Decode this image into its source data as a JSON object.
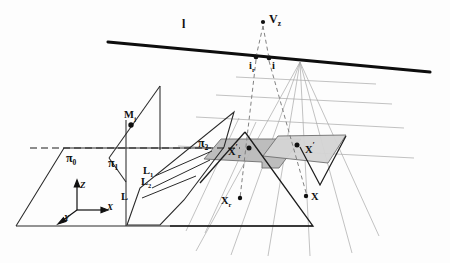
{
  "figure": {
    "background_color": "#fdfdfd",
    "ink_color": "#101010",
    "construction_color": "#9a9a9a",
    "shade_color_dark": "#b5b5b5",
    "shade_color_light": "#d2d2d2"
  },
  "labels": {
    "horizon_line": "l",
    "vanishing_point_z": "V",
    "vanishing_point_z_sub": "z",
    "image_point_r": "i",
    "image_point_r_sub": "r",
    "image_point": "i",
    "plane_0": "π",
    "plane_0_sub": "0",
    "plane_1": "π",
    "plane_1_sub": "1",
    "plane_2": "π",
    "plane_2_sub": "2",
    "model_point": "M",
    "model_point_sub": "j",
    "line_L": "L",
    "line_L1": "L",
    "line_L1_sub": "1",
    "line_L2": "L",
    "line_L2_sub": "2",
    "scene_point_r": "X",
    "scene_point_r_sub": "r",
    "scene_point": "X",
    "image_scene_point_r": "X",
    "image_scene_point_r_prime": "′",
    "image_scene_point_r_sub": "r",
    "image_scene_point": "X",
    "image_scene_point_prime": "′",
    "axis_x": "X",
    "axis_y": "Y",
    "axis_z": "Z"
  },
  "geometry": {
    "horizon_line_endpoints": [
      [
        108,
        42
      ],
      [
        430,
        72
      ]
    ],
    "vanishing_point_z": [
      263,
      22
    ],
    "point_i_r": [
      256,
      58
    ],
    "point_i": [
      269,
      59
    ],
    "point_M": [
      131,
      124
    ],
    "point_X_r": [
      240,
      199
    ],
    "point_X": [
      307,
      197
    ],
    "point_X_prime_r": [
      251,
      148
    ],
    "point_X_prime": [
      300,
      145
    ],
    "camera_center": [
      300,
      62
    ],
    "ground_plane_quad": [
      [
        15,
        225
      ],
      [
        63,
        148
      ],
      [
        210,
        148
      ],
      [
        170,
        225
      ]
    ],
    "plane_pi1_quad": [
      [
        126,
        148
      ],
      [
        126,
        225
      ],
      [
        160,
        110
      ],
      [
        160,
        90
      ]
    ],
    "plane_pi2_quad": [
      [
        128,
        224
      ],
      [
        222,
        145
      ],
      [
        232,
        113
      ],
      [
        138,
        190
      ]
    ],
    "shaded_left_quad": [
      [
        204,
        158
      ],
      [
        222,
        139
      ],
      [
        300,
        140
      ],
      [
        278,
        166
      ]
    ],
    "shaded_right_quad": [
      [
        262,
        155
      ],
      [
        277,
        137
      ],
      [
        345,
        136
      ],
      [
        327,
        161
      ]
    ]
  }
}
